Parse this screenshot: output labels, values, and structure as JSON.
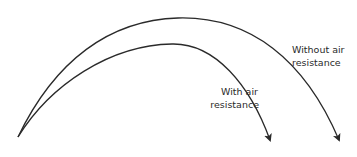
{
  "diagram": {
    "type": "projectile-trajectories",
    "colors": {
      "stroke": "#2a2a2a",
      "background": "#ffffff"
    },
    "trajectories": [
      {
        "name": "without-air-resistance",
        "label_lines": [
          "Without air",
          "resistance"
        ]
      },
      {
        "name": "with-air-resistance",
        "label_lines": [
          "With air",
          "resistance"
        ]
      }
    ]
  }
}
